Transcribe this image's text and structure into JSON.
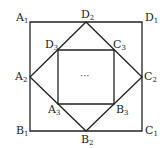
{
  "diagram": {
    "type": "nested-squares",
    "colors": {
      "stroke": "#222222",
      "background": "#ffffff"
    },
    "outer_square": {
      "vertices": [
        {
          "name": "A1",
          "letter": "A",
          "sub": "1",
          "x": 30,
          "y": 22
        },
        {
          "name": "B1",
          "letter": "B",
          "sub": "1",
          "x": 30,
          "y": 131
        },
        {
          "name": "C1",
          "letter": "C",
          "sub": "1",
          "x": 142,
          "y": 131
        },
        {
          "name": "D1",
          "letter": "D",
          "sub": "1",
          "x": 142,
          "y": 22
        }
      ]
    },
    "middle_square": {
      "vertices": [
        {
          "name": "A2",
          "letter": "A",
          "sub": "2",
          "x": 30,
          "y": 77
        },
        {
          "name": "B2",
          "letter": "B",
          "sub": "2",
          "x": 86,
          "y": 131
        },
        {
          "name": "C2",
          "letter": "C",
          "sub": "2",
          "x": 142,
          "y": 77
        },
        {
          "name": "D2",
          "letter": "D",
          "sub": "2",
          "x": 86,
          "y": 22
        }
      ]
    },
    "inner_square": {
      "vertices": [
        {
          "name": "A3",
          "letter": "A",
          "sub": "3",
          "x": 58,
          "y": 104
        },
        {
          "name": "B3",
          "letter": "B",
          "sub": "3",
          "x": 114,
          "y": 104
        },
        {
          "name": "C3",
          "letter": "C",
          "sub": "3",
          "x": 114,
          "y": 50
        },
        {
          "name": "D3",
          "letter": "D",
          "sub": "3",
          "x": 58,
          "y": 50
        }
      ]
    },
    "center_text": "···",
    "labels": {
      "A1": {
        "letter": "A",
        "sub": "1"
      },
      "B1": {
        "letter": "B",
        "sub": "1"
      },
      "C1": {
        "letter": "C",
        "sub": "1"
      },
      "D1": {
        "letter": "D",
        "sub": "1"
      },
      "A2": {
        "letter": "A",
        "sub": "2"
      },
      "B2": {
        "letter": "B",
        "sub": "2"
      },
      "C2": {
        "letter": "C",
        "sub": "2"
      },
      "D2": {
        "letter": "D",
        "sub": "2"
      },
      "A3": {
        "letter": "A",
        "sub": "3"
      },
      "B3": {
        "letter": "B",
        "sub": "3"
      },
      "C3": {
        "letter": "C",
        "sub": "3"
      },
      "D3": {
        "letter": "D",
        "sub": "3"
      }
    }
  }
}
